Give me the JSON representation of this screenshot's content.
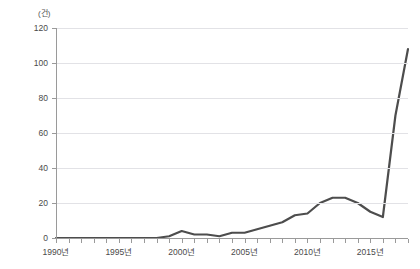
{
  "chart_data": {
    "type": "line",
    "title": "",
    "subtitle": "",
    "unit_label": "(건)",
    "xlabel": "",
    "ylabel": "",
    "ylim": [
      0,
      120
    ],
    "xlim": [
      1990,
      2018
    ],
    "grid": true,
    "legend": false,
    "legend_position": "none",
    "y_ticks": [
      0,
      20,
      40,
      60,
      80,
      100,
      120
    ],
    "y_tick_labels": [
      "0",
      "20",
      "40",
      "60",
      "80",
      "100",
      "120"
    ],
    "x_tick_years": [
      1990,
      1991,
      1992,
      1993,
      1994,
      1995,
      1996,
      1997,
      1998,
      1999,
      2000,
      2001,
      2002,
      2003,
      2004,
      2005,
      2006,
      2007,
      2008,
      2009,
      2010,
      2011,
      2012,
      2013,
      2014,
      2015,
      2016,
      2017,
      2018
    ],
    "x_labeled_ticks": [
      {
        "year": 1990,
        "label": "1990년"
      },
      {
        "year": 1995,
        "label": "1995년"
      },
      {
        "year": 2000,
        "label": "2000년"
      },
      {
        "year": 2005,
        "label": "2005년"
      },
      {
        "year": 2010,
        "label": "2010년"
      },
      {
        "year": 2015,
        "label": "2015년"
      }
    ],
    "series": [
      {
        "name": "건수",
        "color": "#4d4d4d",
        "x": [
          1990,
          1991,
          1992,
          1993,
          1994,
          1995,
          1996,
          1997,
          1998,
          1999,
          2000,
          2001,
          2002,
          2003,
          2004,
          2005,
          2006,
          2007,
          2008,
          2009,
          2010,
          2011,
          2012,
          2013,
          2014,
          2015,
          2016,
          2017,
          2018
        ],
        "values": [
          0,
          0,
          0,
          0,
          0,
          0,
          0,
          0,
          0,
          1,
          4,
          2,
          2,
          1,
          3,
          3,
          5,
          7,
          9,
          13,
          14,
          20,
          23,
          23,
          20,
          15,
          19,
          17,
          12
        ]
      }
    ],
    "colors": {
      "line": "#4d4d4d",
      "grid": "#e2e2e6",
      "axis": "#9a9a9a",
      "text": "#4a4a4a",
      "background": "#ffffff"
    }
  },
  "chart_full_series": {
    "x": [
      1990,
      1991,
      1992,
      1993,
      1994,
      1995,
      1996,
      1997,
      1998,
      1999,
      2000,
      2001,
      2002,
      2003,
      2004,
      2005,
      2006,
      2007,
      2008,
      2009,
      2010,
      2011,
      2012,
      2013,
      2014,
      2015,
      2016,
      2017,
      2018
    ],
    "values": [
      0,
      0,
      0,
      0,
      0,
      0,
      0,
      0,
      0,
      1,
      4,
      2,
      2,
      1,
      3,
      3,
      5,
      7,
      9,
      13,
      14,
      20,
      23,
      23,
      20,
      15,
      19,
      12,
      70
    ]
  }
}
